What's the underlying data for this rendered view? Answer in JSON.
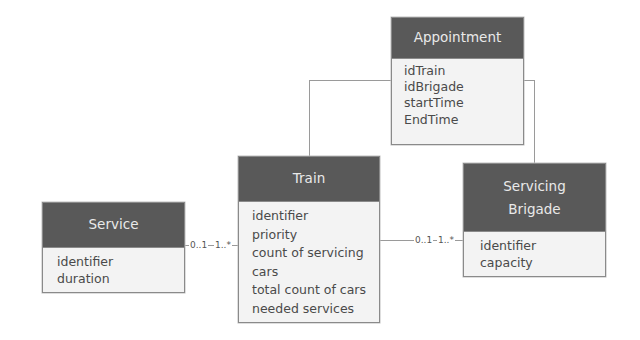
{
  "diagram": {
    "type": "UML class diagram",
    "classes": {
      "appointment": {
        "name": "Appointment",
        "attributes": [
          "idTrain",
          "idBrigade",
          "startTime",
          "EndTime"
        ]
      },
      "train": {
        "name": "Train",
        "attributes": [
          "identifier",
          "priority",
          "count of servicing",
          "cars",
          "total count of cars",
          "needed services"
        ]
      },
      "service": {
        "name": "Service",
        "attributes": [
          "identifier",
          "duration"
        ]
      },
      "brigade": {
        "name": "Servicing Brigade",
        "name_lines": [
          "Servicing",
          "Brigade"
        ],
        "attributes": [
          "identifier",
          "capacity"
        ]
      }
    },
    "associations": [
      {
        "from": "Service",
        "to": "Train",
        "from_multiplicity": "0..1",
        "to_multiplicity": "1..*"
      },
      {
        "from": "Train",
        "to": "Servicing Brigade",
        "from_multiplicity": "0..1",
        "to_multiplicity": "1..*"
      },
      {
        "from": "Appointment",
        "to": "Train",
        "from_multiplicity": "",
        "to_multiplicity": ""
      },
      {
        "from": "Appointment",
        "to": "Servicing Brigade",
        "from_multiplicity": "",
        "to_multiplicity": ""
      }
    ],
    "colors": {
      "header_bg": "#595959",
      "header_text": "#e9e9e9",
      "body_bg": "#f3f3f3",
      "border": "#8a8a8a",
      "connector": "#9a9a9a"
    }
  }
}
